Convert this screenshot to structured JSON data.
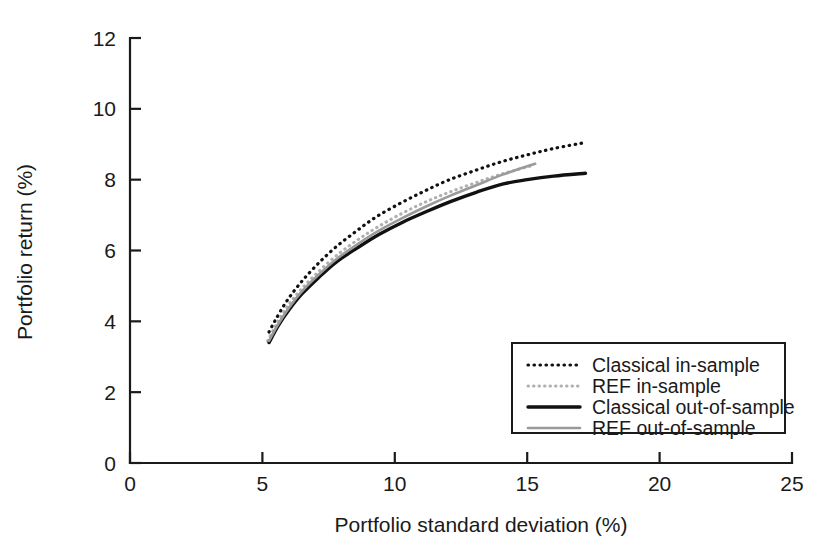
{
  "chart_data": {
    "type": "line",
    "title": "",
    "xlabel": "Portfolio standard deviation (%)",
    "ylabel": "Portfolio return (%)",
    "xlim": [
      0,
      25
    ],
    "ylim": [
      0,
      12
    ],
    "xticks": [
      "0",
      "5",
      "10",
      "15",
      "20",
      "25"
    ],
    "xtick_values": [
      0,
      5,
      10,
      15,
      20,
      25
    ],
    "yticks": [
      "0",
      "2",
      "4",
      "6",
      "8",
      "10",
      "12"
    ],
    "ytick_values": [
      0,
      2,
      4,
      6,
      8,
      10,
      12
    ],
    "grid": false,
    "legend_position": "lower-right",
    "series": [
      {
        "name": "Classical in-sample",
        "style": "dotted",
        "color": "#111111",
        "width": 3.2,
        "dash": "0.5,5.5",
        "x": [
          5.25,
          5.5,
          5.9,
          6.4,
          7.0,
          7.7,
          8.5,
          9.3,
          10.2,
          11.1,
          12.0,
          13.0,
          14.0,
          15.0,
          16.0,
          17.2
        ],
        "y": [
          3.7,
          4.05,
          4.55,
          5.05,
          5.55,
          6.05,
          6.52,
          6.95,
          7.33,
          7.67,
          7.98,
          8.25,
          8.5,
          8.7,
          8.88,
          9.05
        ]
      },
      {
        "name": "REF in-sample",
        "style": "dotted",
        "color": "#b0b0b0",
        "width": 3.0,
        "dash": "0.5,5.0",
        "x": [
          5.2,
          5.5,
          5.9,
          6.4,
          7.0,
          7.7,
          8.5,
          9.3,
          10.2,
          11.1,
          12.0,
          13.0,
          14.0,
          15.2
        ],
        "y": [
          3.45,
          3.88,
          4.38,
          4.85,
          5.32,
          5.8,
          6.25,
          6.64,
          7.02,
          7.35,
          7.63,
          7.9,
          8.15,
          8.4
        ]
      },
      {
        "name": "Classical out-of-sample",
        "style": "solid",
        "color": "#111111",
        "width": 3.4,
        "dash": "none",
        "x": [
          5.25,
          5.6,
          6.0,
          6.5,
          7.1,
          7.8,
          8.6,
          9.4,
          10.3,
          11.2,
          12.1,
          13.1,
          14.1,
          15.0,
          16.0,
          17.2
        ],
        "y": [
          3.4,
          3.88,
          4.32,
          4.78,
          5.22,
          5.68,
          6.08,
          6.45,
          6.8,
          7.1,
          7.38,
          7.65,
          7.88,
          8.0,
          8.1,
          8.18
        ]
      },
      {
        "name": "REF out-of-sample",
        "style": "solid",
        "color": "#9a9a9a",
        "width": 2.6,
        "dash": "none",
        "x": [
          5.25,
          5.6,
          6.0,
          6.5,
          7.1,
          7.8,
          8.6,
          9.4,
          10.3,
          11.2,
          12.1,
          13.1,
          14.1,
          15.3
        ],
        "y": [
          3.45,
          3.92,
          4.38,
          4.85,
          5.3,
          5.76,
          6.18,
          6.56,
          6.92,
          7.25,
          7.55,
          7.85,
          8.15,
          8.45
        ]
      }
    ]
  },
  "legend": {
    "entries": [
      {
        "label": "Classical in-sample"
      },
      {
        "label": "REF in-sample"
      },
      {
        "label": "Classical out-of-sample"
      },
      {
        "label": "REF out-of-sample"
      }
    ]
  },
  "colors": {
    "axis": "#1a1a1a",
    "background": "#ffffff",
    "classical": "#111111",
    "ref": "#9a9a9a"
  }
}
